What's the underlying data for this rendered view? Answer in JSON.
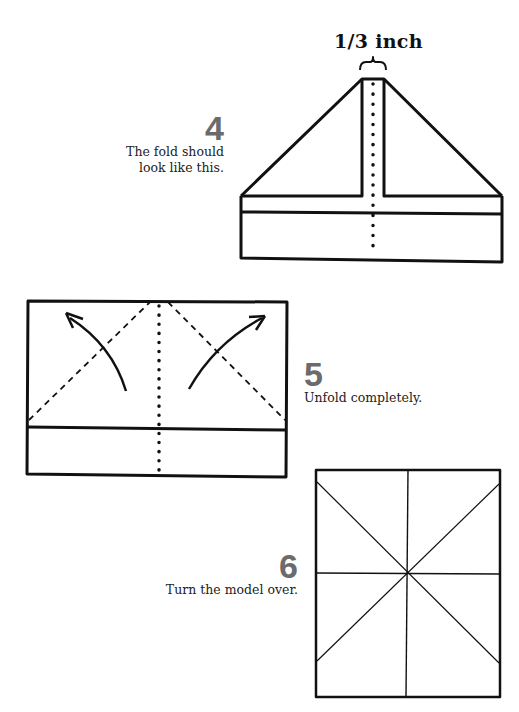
{
  "steps": [
    {
      "number": "4",
      "instruction_line1": "The fold should",
      "instruction_line2": "look like this."
    },
    {
      "number": "5",
      "instruction": "Unfold completely."
    },
    {
      "number": "6",
      "instruction": "Turn the model over."
    }
  ],
  "annotations": {
    "measure_label": "1/3 inch"
  },
  "colors": {
    "line": "#111111",
    "step_number": "#6b6b6b",
    "text": "#222222"
  }
}
